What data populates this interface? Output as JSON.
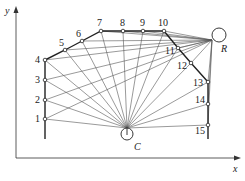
{
  "axes": {
    "x_label": "x",
    "y_label": "y"
  },
  "hubs": {
    "R": {
      "label": "R",
      "cx": 219,
      "cy": 35,
      "r": 7,
      "join": [
        212,
        40
      ],
      "label_pos": [
        221,
        52
      ]
    },
    "C": {
      "label": "C",
      "cx": 127,
      "cy": 134,
      "r": 6,
      "join": [
        127,
        128
      ],
      "label_pos": [
        134,
        150
      ]
    }
  },
  "points": [
    {
      "id": "1",
      "label": "1",
      "x": 45,
      "y": 119,
      "lx": 35,
      "ly": 122
    },
    {
      "id": "2",
      "label": "2",
      "x": 45,
      "y": 100,
      "lx": 35,
      "ly": 103
    },
    {
      "id": "3",
      "label": "3",
      "x": 45,
      "y": 80,
      "lx": 35,
      "ly": 83
    },
    {
      "id": "4",
      "label": "4",
      "x": 45,
      "y": 60,
      "lx": 35,
      "ly": 63
    },
    {
      "id": "5",
      "label": "5",
      "x": 65,
      "y": 50,
      "lx": 59,
      "ly": 46
    },
    {
      "id": "6",
      "label": "6",
      "x": 82,
      "y": 41,
      "lx": 76,
      "ly": 37
    },
    {
      "id": "7",
      "label": "7",
      "x": 101,
      "y": 31,
      "lx": 97,
      "ly": 26
    },
    {
      "id": "8",
      "label": "8",
      "x": 123,
      "y": 31,
      "lx": 120,
      "ly": 26
    },
    {
      "id": "9",
      "label": "9",
      "x": 143,
      "y": 31,
      "lx": 140,
      "ly": 26
    },
    {
      "id": "10",
      "label": "10",
      "x": 164,
      "y": 31,
      "lx": 158,
      "ly": 26
    },
    {
      "id": "11",
      "label": "11",
      "x": 178,
      "y": 48,
      "lx": 165,
      "ly": 54
    },
    {
      "id": "12",
      "label": "12",
      "x": 191,
      "y": 63,
      "lx": 177,
      "ly": 69
    },
    {
      "id": "13",
      "label": "13",
      "x": 208,
      "y": 82,
      "lx": 193,
      "ly": 86
    },
    {
      "id": "14",
      "label": "14",
      "x": 208,
      "y": 104,
      "lx": 195,
      "ly": 103
    },
    {
      "id": "15",
      "label": "15",
      "x": 208,
      "y": 125,
      "lx": 195,
      "ly": 134
    }
  ],
  "rays_to_R": [
    "1",
    "2",
    "3",
    "4",
    "5",
    "6",
    "7",
    "8",
    "9",
    "10",
    "11",
    "12",
    "13",
    "14",
    "15"
  ],
  "rays_to_C": [
    "1",
    "2",
    "3",
    "4",
    "5",
    "6",
    "7",
    "8",
    "9",
    "10",
    "11",
    "12",
    "13",
    "14",
    "15"
  ],
  "boundary": {
    "left_bottom": [
      45,
      139
    ],
    "right_bottom": [
      208,
      139
    ]
  }
}
